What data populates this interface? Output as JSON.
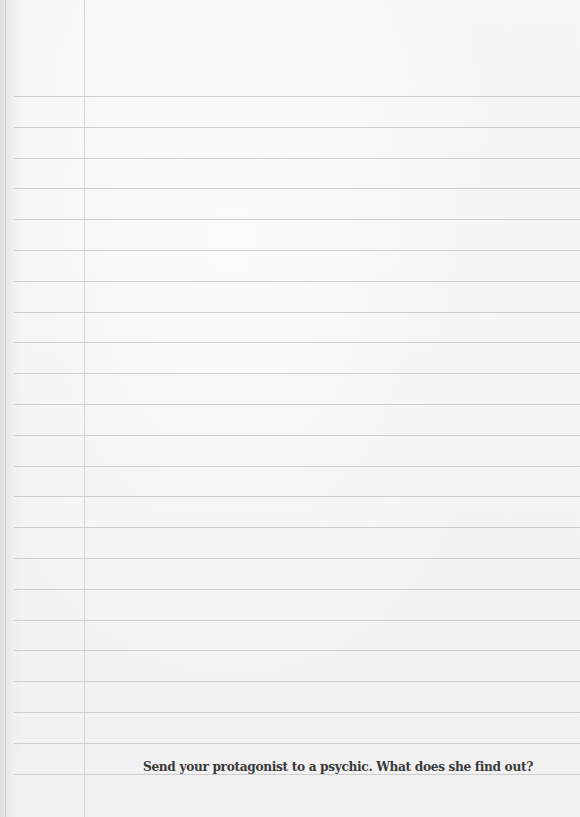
{
  "paper": {
    "type": "ruled-notebook-page",
    "line_color": "#cfcfcf",
    "margin_line_color": "#d4d4d4",
    "background_color": "#f3f3f3",
    "first_line_y": 96,
    "line_spacing": 30.8,
    "line_count": 23,
    "margin_x": 84
  },
  "prompt": {
    "text": "Send your protagonist to a psychic. What does she find out?",
    "color": "#3a3a3a"
  }
}
